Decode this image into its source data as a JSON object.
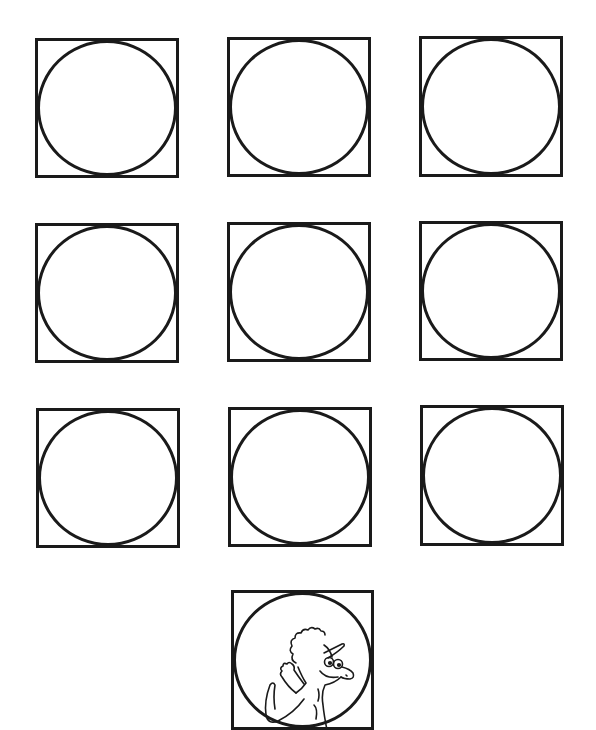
{
  "worksheet": {
    "background": "#ffffff",
    "stroke_color": "#1a1a1a",
    "cells": [
      {
        "row": 1,
        "col": 1,
        "x": 35,
        "y": 38,
        "w": 144,
        "h": 140,
        "content": "empty-circle"
      },
      {
        "row": 1,
        "col": 2,
        "x": 227,
        "y": 37,
        "w": 144,
        "h": 140,
        "content": "empty-circle"
      },
      {
        "row": 1,
        "col": 3,
        "x": 419,
        "y": 36,
        "w": 144,
        "h": 141,
        "content": "empty-circle"
      },
      {
        "row": 2,
        "col": 1,
        "x": 35,
        "y": 223,
        "w": 144,
        "h": 140,
        "content": "empty-circle"
      },
      {
        "row": 2,
        "col": 2,
        "x": 227,
        "y": 222,
        "w": 144,
        "h": 140,
        "content": "empty-circle"
      },
      {
        "row": 2,
        "col": 3,
        "x": 419,
        "y": 221,
        "w": 144,
        "h": 140,
        "content": "empty-circle"
      },
      {
        "row": 3,
        "col": 1,
        "x": 36,
        "y": 408,
        "w": 144,
        "h": 140,
        "content": "empty-circle"
      },
      {
        "row": 3,
        "col": 2,
        "x": 228,
        "y": 407,
        "w": 144,
        "h": 140,
        "content": "empty-circle"
      },
      {
        "row": 3,
        "col": 3,
        "x": 420,
        "y": 405,
        "w": 144,
        "h": 141,
        "content": "empty-circle"
      },
      {
        "row": 4,
        "col": 2,
        "x": 231,
        "y": 590,
        "w": 143,
        "h": 140,
        "content": "dinosaur-illustration"
      }
    ]
  }
}
